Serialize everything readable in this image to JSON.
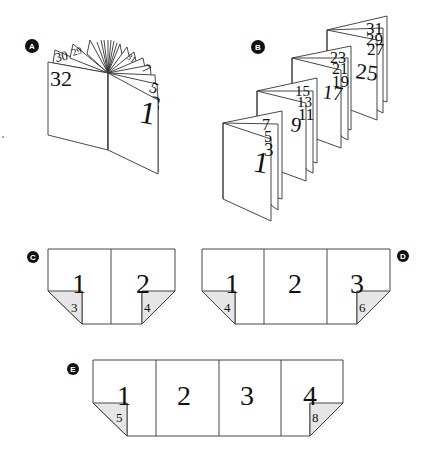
{
  "figure": {
    "panels": [
      {
        "id": "A",
        "label": "A",
        "description": "saddle-stitched booklet fanned open",
        "left_page_number": "32",
        "right_page_numbers": [
          "1",
          "3",
          "5",
          "7"
        ],
        "fan_back_numbers": [
          "30",
          "29",
          "31"
        ]
      },
      {
        "id": "B",
        "label": "B",
        "description": "accordion folded signatures",
        "groups": [
          {
            "front": "1",
            "behind": [
              "3",
              "5",
              "7"
            ]
          },
          {
            "front": "9",
            "behind": [
              "11",
              "13",
              "15"
            ]
          },
          {
            "front": "17",
            "behind": [
              "19",
              "21",
              "23"
            ]
          },
          {
            "front": "25",
            "behind": [
              "27",
              "29",
              "31"
            ]
          }
        ]
      },
      {
        "id": "C",
        "label": "C",
        "description": "two-panel sheet with folded corners",
        "panels": [
          "1",
          "2"
        ],
        "flaps": [
          "3",
          "4"
        ]
      },
      {
        "id": "D",
        "label": "D",
        "description": "three-panel sheet with folded corners",
        "panels": [
          "1",
          "2",
          "3"
        ],
        "flaps": [
          "4",
          "6"
        ]
      },
      {
        "id": "E",
        "label": "E",
        "description": "four-panel sheet with folded corners",
        "panels": [
          "1",
          "2",
          "3",
          "4"
        ],
        "flaps": [
          "5",
          "8"
        ]
      }
    ],
    "colors": {
      "line": "#333333",
      "flap_fill": "#e6e6e6",
      "badge_fill": "#111111",
      "badge_text": "#ffffff"
    }
  }
}
